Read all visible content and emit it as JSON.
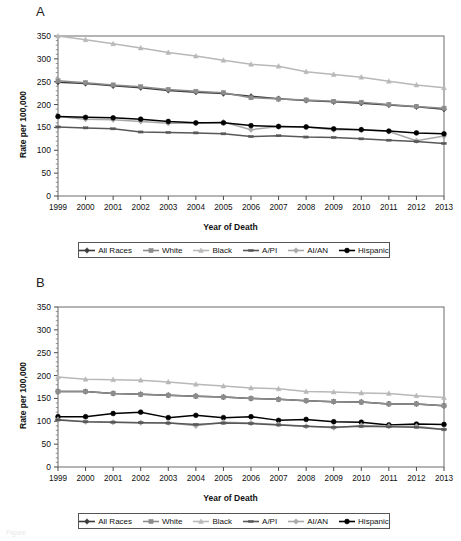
{
  "figure": {
    "panel_a_letter": "A",
    "panel_b_letter": "B",
    "caption_fragment": "Figure"
  },
  "axes": {
    "ylabel": "Rate per 100,000",
    "xlabel": "Year of Death",
    "yticks": [
      "0",
      "50",
      "100",
      "150",
      "200",
      "250",
      "300",
      "350"
    ],
    "xticks": [
      "1999",
      "2000",
      "2001",
      "2002",
      "2003",
      "2004",
      "2005",
      "2006",
      "2007",
      "2008",
      "2009",
      "2010",
      "2011",
      "2012",
      "2013"
    ]
  },
  "legend": {
    "items": [
      {
        "label": "All Races",
        "color": "#3b3b3b",
        "marker": "diamond"
      },
      {
        "label": "White",
        "color": "#8c8c8c",
        "marker": "square"
      },
      {
        "label": "Black",
        "color": "#b8b8b8",
        "marker": "triangle"
      },
      {
        "label": "A/PI",
        "color": "#585858",
        "marker": "bar"
      },
      {
        "label": "AI/AN",
        "color": "#a8a8a8",
        "marker": "diamond"
      },
      {
        "label": "Hispanic",
        "color": "#000000",
        "marker": "circle"
      }
    ]
  },
  "chart_data": [
    {
      "panel": "A",
      "type": "line",
      "title": "A",
      "xlabel": "Year of Death",
      "ylabel": "Rate per 100,000",
      "ylim": [
        0,
        350
      ],
      "ytick_step": 50,
      "grid": false,
      "legend_position": "bottom",
      "x": [
        1999,
        2000,
        2001,
        2002,
        2003,
        2004,
        2005,
        2006,
        2007,
        2008,
        2009,
        2010,
        2011,
        2012,
        2013
      ],
      "series": [
        {
          "name": "Black",
          "color": "#b8b8b8",
          "marker": "triangle",
          "values": [
            350,
            342,
            333,
            324,
            314,
            306,
            297,
            288,
            284,
            272,
            266,
            260,
            251,
            243,
            237
          ]
        },
        {
          "name": "All Races",
          "color": "#3b3b3b",
          "marker": "diamond",
          "values": [
            249,
            246,
            241,
            237,
            231,
            227,
            224,
            218,
            213,
            209,
            206,
            203,
            199,
            195,
            190
          ]
        },
        {
          "name": "White",
          "color": "#8c8c8c",
          "marker": "square",
          "values": [
            252,
            248,
            243,
            239,
            233,
            229,
            226,
            215,
            212,
            210,
            207,
            205,
            200,
            196,
            192
          ]
        },
        {
          "name": "AI/AN",
          "color": "#a8a8a8",
          "marker": "diamond",
          "values": [
            174,
            168,
            167,
            163,
            159,
            159,
            162,
            145,
            152,
            151,
            145,
            145,
            141,
            121,
            131
          ]
        },
        {
          "name": "Hispanic",
          "color": "#000000",
          "marker": "circle",
          "values": [
            174,
            172,
            171,
            168,
            163,
            160,
            160,
            154,
            152,
            151,
            147,
            145,
            142,
            138,
            136
          ]
        },
        {
          "name": "A/PI",
          "color": "#585858",
          "marker": "bar",
          "values": [
            151,
            149,
            147,
            140,
            139,
            138,
            136,
            130,
            132,
            129,
            128,
            125,
            122,
            119,
            115
          ]
        }
      ]
    },
    {
      "panel": "B",
      "type": "line",
      "title": "B",
      "xlabel": "Year of Death",
      "ylabel": "Rate per 100,000",
      "ylim": [
        0,
        350
      ],
      "ytick_step": 50,
      "grid": false,
      "legend_position": "bottom",
      "x": [
        1999,
        2000,
        2001,
        2002,
        2003,
        2004,
        2005,
        2006,
        2007,
        2008,
        2009,
        2010,
        2011,
        2012,
        2013
      ],
      "series": [
        {
          "name": "Black",
          "color": "#b8b8b8",
          "marker": "triangle",
          "values": [
            197,
            192,
            191,
            190,
            186,
            181,
            177,
            173,
            171,
            165,
            164,
            162,
            161,
            156,
            152
          ]
        },
        {
          "name": "All Races",
          "color": "#3b3b3b",
          "marker": "diamond",
          "values": [
            165,
            165,
            161,
            159,
            157,
            155,
            153,
            150,
            148,
            145,
            143,
            142,
            138,
            138,
            134
          ]
        },
        {
          "name": "White",
          "color": "#8c8c8c",
          "marker": "square",
          "values": [
            165,
            165,
            161,
            159,
            157,
            155,
            153,
            150,
            148,
            145,
            143,
            142,
            138,
            138,
            134
          ]
        },
        {
          "name": "Hispanic",
          "color": "#000000",
          "marker": "circle",
          "values": [
            110,
            110,
            117,
            120,
            108,
            113,
            108,
            110,
            102,
            104,
            99,
            98,
            92,
            94,
            93
          ]
        },
        {
          "name": "AI/AN",
          "color": "#a8a8a8",
          "marker": "diamond",
          "values": [
            104,
            99,
            98,
            97,
            97,
            90,
            98,
            96,
            93,
            89,
            86,
            91,
            89,
            89,
            82
          ]
        },
        {
          "name": "A/PI",
          "color": "#585858",
          "marker": "bar",
          "values": [
            103,
            99,
            98,
            97,
            96,
            93,
            96,
            95,
            92,
            89,
            87,
            89,
            88,
            87,
            82
          ]
        }
      ]
    }
  ]
}
